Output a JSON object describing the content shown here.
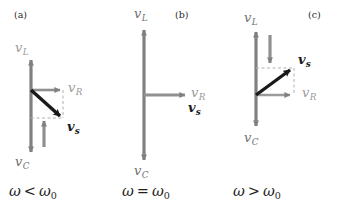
{
  "figure": {
    "background_color": "#ffffff",
    "colors": {
      "axis_gray": "#808080",
      "label_gray": "#9a9a9a",
      "label_dark_gray": "#6f6f6f",
      "resultant_black": "#1a1a1a",
      "dashed_gray": "#a8a8a8"
    }
  },
  "panels": [
    {
      "tag": "(a)",
      "condition": {
        "omega": "ω",
        "operator": "<",
        "omega0": "ω",
        "omega0_sub": "0"
      },
      "vectors": [
        {
          "name": "vL",
          "symbol": "v",
          "sub": "L",
          "direction": "up",
          "color": "gray",
          "description": "inductor voltage phasor, points up"
        },
        {
          "name": "vC",
          "symbol": "v",
          "sub": "C",
          "direction": "down",
          "color": "gray",
          "description": "capacitor voltage phasor, points down, larger than vL"
        },
        {
          "name": "vR",
          "symbol": "v",
          "sub": "R",
          "direction": "right",
          "color": "gray",
          "description": "resistor voltage phasor, points right"
        },
        {
          "name": "vs",
          "symbol": "v",
          "sub": "s",
          "direction": "down-right",
          "color": "black",
          "description": "source voltage phasor, resultant lags, points down-right"
        }
      ]
    },
    {
      "tag": "(b)",
      "condition": {
        "omega": "ω",
        "operator": "=",
        "omega0": "ω",
        "omega0_sub": "0"
      },
      "vectors": [
        {
          "name": "vL",
          "symbol": "v",
          "sub": "L",
          "direction": "up",
          "color": "gray",
          "description": "inductor voltage phasor, points up"
        },
        {
          "name": "vC",
          "symbol": "v",
          "sub": "C",
          "direction": "down",
          "color": "gray",
          "description": "capacitor voltage phasor, points down, equal to vL"
        },
        {
          "name": "vR",
          "symbol": "v",
          "sub": "R",
          "direction": "right",
          "color": "gray",
          "description": "resistor voltage phasor, points right"
        },
        {
          "name": "vs",
          "symbol": "v",
          "sub": "s",
          "direction": "right",
          "color": "black",
          "description": "source voltage phasor equals vR at resonance"
        }
      ]
    },
    {
      "tag": "(c)",
      "condition": {
        "omega": "ω",
        "operator": ">",
        "omega0": "ω",
        "omega0_sub": "0"
      },
      "vectors": [
        {
          "name": "vL",
          "symbol": "v",
          "sub": "L",
          "direction": "up",
          "color": "gray",
          "description": "inductor voltage phasor, points up, larger than vC"
        },
        {
          "name": "vC",
          "symbol": "v",
          "sub": "C",
          "direction": "down",
          "color": "gray",
          "description": "capacitor voltage phasor, points down"
        },
        {
          "name": "vR",
          "symbol": "v",
          "sub": "R",
          "direction": "right",
          "color": "gray",
          "description": "resistor voltage phasor, points right"
        },
        {
          "name": "vs",
          "symbol": "v",
          "sub": "s",
          "direction": "up-right",
          "color": "black",
          "description": "source voltage phasor leads, points up-right"
        }
      ]
    }
  ]
}
